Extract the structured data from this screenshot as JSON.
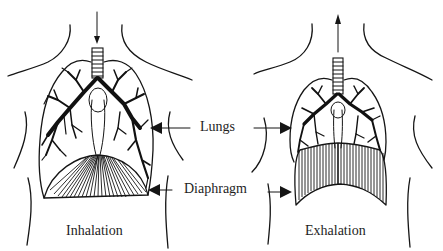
{
  "diagram": {
    "type": "anatomical-comparison",
    "panels": [
      {
        "id": "inhalation",
        "caption": "Inhalation",
        "airflow_direction": "in (arrow pointing down into trachea)",
        "diaphragm_state": "contracted, flattened / lowered",
        "lungs_state": "expanded"
      },
      {
        "id": "exhalation",
        "caption": "Exhalation",
        "airflow_direction": "out (arrow pointing up out of trachea)",
        "diaphragm_state": "relaxed, dome raised",
        "lungs_state": "contracted"
      }
    ],
    "labels": {
      "lungs": "Lungs",
      "diaphragm": "Diaphragm"
    },
    "colors": {
      "ink": "#151515",
      "background": "#ffffff"
    }
  }
}
